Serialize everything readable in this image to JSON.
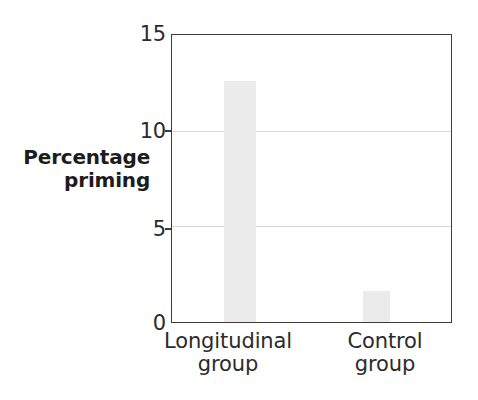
{
  "chart_data": {
    "type": "bar",
    "title": "",
    "subtitle": "",
    "xlabel": "",
    "ylabel": "Percentage priming",
    "ylabel_line1": "Percentage",
    "ylabel_line2": "priming",
    "categories": [
      "Longitudinal group",
      "Control group"
    ],
    "category_lines": [
      {
        "line1": "Longitudinal",
        "line2": "group"
      },
      {
        "line1": "Control",
        "line2": "group"
      }
    ],
    "values": [
      12.6,
      1.6
    ],
    "ylim": [
      0,
      15
    ],
    "yticks": [
      0,
      5,
      10,
      15
    ],
    "ytick_labels": [
      "0",
      "5",
      "10",
      "15"
    ],
    "grid": "horizontal",
    "gridline_values": [
      5,
      10
    ],
    "legend": "none",
    "bar_color": "#ebebeb",
    "gridline_color": "#d9d9d9",
    "frame_color": "#3c3c3c",
    "text_color": "#2b2b2b",
    "background_color": "#ffffff"
  }
}
